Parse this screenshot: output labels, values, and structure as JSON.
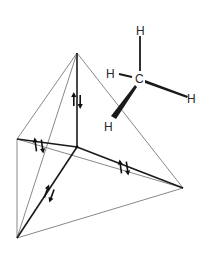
{
  "diagram": {
    "tetrahedron": {
      "vertices": {
        "apex": [
          77,
          53
        ],
        "center": [
          77,
          147
        ],
        "left": [
          17,
          139
        ],
        "right": [
          183,
          188
        ],
        "bottom": [
          17,
          238
        ]
      },
      "thin_edges": [
        [
          "apex",
          "left"
        ],
        [
          "apex",
          "bottom"
        ],
        [
          "apex",
          "right"
        ],
        [
          "left",
          "right"
        ],
        [
          "left",
          "bottom"
        ],
        [
          "bottom",
          "right"
        ]
      ],
      "bonds": [
        [
          "center",
          "apex"
        ],
        [
          "center",
          "left"
        ],
        [
          "center",
          "right"
        ],
        [
          "center",
          "bottom"
        ]
      ]
    },
    "electron_pairs": [
      {
        "name": "pair-top",
        "x": 77,
        "y": 101,
        "angle": 0
      },
      {
        "name": "pair-left",
        "x": 39,
        "y": 146,
        "angle": -8
      },
      {
        "name": "pair-right",
        "x": 124,
        "y": 168,
        "angle": -8
      },
      {
        "name": "pair-bottom",
        "x": 49,
        "y": 194,
        "angle": 20
      }
    ],
    "molecule": {
      "center_atom": {
        "label": "C",
        "x": 139,
        "y": 79
      },
      "substituents": [
        {
          "label": "H",
          "x": 141,
          "y": 31,
          "bond": "plain"
        },
        {
          "label": "H",
          "x": 112,
          "y": 73,
          "bond": "plain"
        },
        {
          "label": "H",
          "x": 192,
          "y": 98,
          "bond": "wedge"
        },
        {
          "label": "H",
          "x": 108,
          "y": 126,
          "bond": "wedge"
        }
      ]
    }
  }
}
